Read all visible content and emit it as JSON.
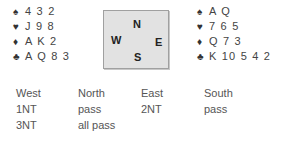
{
  "west_hand": {
    "suits": [
      {
        "icon": "♠",
        "icon_name": "spade-icon",
        "cards": "4 3 2"
      },
      {
        "icon": "♥",
        "icon_name": "heart-icon",
        "cards": "J 9 8"
      },
      {
        "icon": "♦",
        "icon_name": "diamond-icon",
        "cards": "A K 2"
      },
      {
        "icon": "♣",
        "icon_name": "club-icon",
        "cards": "A Q 8 3"
      }
    ]
  },
  "east_hand": {
    "suits": [
      {
        "icon": "♠",
        "icon_name": "spade-icon",
        "cards": "A Q"
      },
      {
        "icon": "♥",
        "icon_name": "heart-icon",
        "cards": "7 6 5"
      },
      {
        "icon": "♦",
        "icon_name": "diamond-icon",
        "cards": "Q 7 3"
      },
      {
        "icon": "♣",
        "icon_name": "club-icon",
        "cards": "K 10 5 4 2"
      }
    ]
  },
  "compass": {
    "north": "N",
    "west": "W",
    "east": "E",
    "south": "S"
  },
  "auction": {
    "headers": [
      "West",
      "North",
      "East",
      "South"
    ],
    "rows": [
      [
        "1NT",
        "pass",
        "2NT",
        "pass"
      ],
      [
        "3NT",
        "all pass",
        "",
        ""
      ]
    ]
  }
}
